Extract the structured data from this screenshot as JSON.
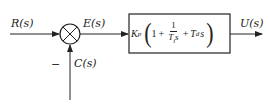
{
  "diagram": {
    "type": "PID feedback block diagram",
    "signals": {
      "input": "R(s)",
      "error": "E(s)",
      "feedback": "C(s)",
      "output": "U(s)"
    },
    "summing_junction": {
      "feedback_sign": "−"
    },
    "controller": {
      "gain": "K",
      "gain_sub": "p",
      "one": "1",
      "plus1": "+",
      "frac_num": "1",
      "frac_den_T": "T",
      "frac_den_sub": "i",
      "frac_den_s": "s",
      "plus2": "+",
      "td_T": "T",
      "td_sub": "d",
      "td_s": "s"
    },
    "colors": {
      "line": "#222222"
    }
  }
}
